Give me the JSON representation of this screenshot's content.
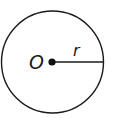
{
  "diagram": {
    "center_label": "O",
    "radius_label": "r",
    "colors": {
      "stroke": "#1a1a1a",
      "background": "#ffffff"
    }
  }
}
